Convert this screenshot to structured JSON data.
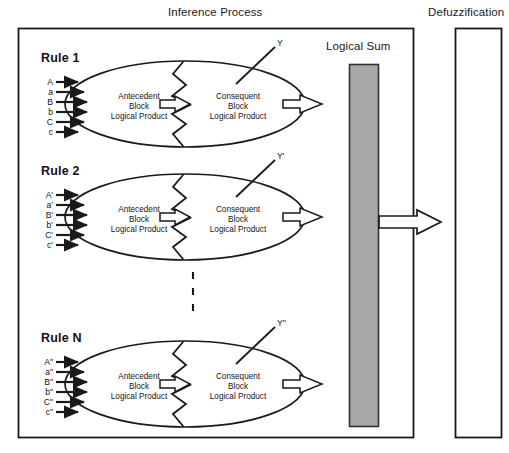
{
  "diagram": {
    "inference_title": "Inference Process",
    "defuzzification_title": "Defuzzification",
    "logical_sum_title": "Logical Sum",
    "block_text": {
      "antecedent_line1": "Antecedent",
      "antecedent_line2": "Block",
      "antecedent_line3": "Logical Product",
      "consequent_line1": "Consequent",
      "consequent_line2": "Block",
      "consequent_line3": "Logical Product"
    },
    "rules": [
      {
        "name": "Rule 1",
        "inputs": [
          "A",
          "a",
          "B",
          "b",
          "C",
          "c"
        ],
        "output": "Y"
      },
      {
        "name": "Rule 2",
        "inputs": [
          "A'",
          "a'",
          "B'",
          "b'",
          "C'",
          "c'"
        ],
        "output": "Y'"
      },
      {
        "name": "Rule N",
        "inputs": [
          "A\"",
          "a\"",
          "B\"",
          "b\"",
          "C\"",
          "c\""
        ],
        "output": "Y\""
      }
    ],
    "colors": {
      "stroke": "#1a1a1a",
      "logical_sum_fill": "#a8a8a8",
      "logical_sum_stroke": "#333333",
      "background": "#ffffff"
    }
  }
}
